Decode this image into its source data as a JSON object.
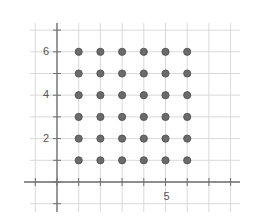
{
  "chart_data": {
    "type": "scatter",
    "title": "",
    "xlabel": "",
    "ylabel": "",
    "xlim": [
      -1,
      8
    ],
    "ylim": [
      -1,
      7
    ],
    "grid": true,
    "x_tick_labels": [
      {
        "value": 5,
        "label": "5"
      }
    ],
    "y_tick_labels": [
      {
        "value": 2,
        "label": "2"
      },
      {
        "value": 4,
        "label": "4"
      },
      {
        "value": 6,
        "label": "6"
      }
    ],
    "points": [
      [
        1,
        1
      ],
      [
        2,
        1
      ],
      [
        3,
        1
      ],
      [
        4,
        1
      ],
      [
        5,
        1
      ],
      [
        6,
        1
      ],
      [
        1,
        2
      ],
      [
        2,
        2
      ],
      [
        3,
        2
      ],
      [
        4,
        2
      ],
      [
        5,
        2
      ],
      [
        6,
        2
      ],
      [
        1,
        3
      ],
      [
        2,
        3
      ],
      [
        3,
        3
      ],
      [
        4,
        3
      ],
      [
        5,
        3
      ],
      [
        6,
        3
      ],
      [
        1,
        4
      ],
      [
        2,
        4
      ],
      [
        3,
        4
      ],
      [
        4,
        4
      ],
      [
        5,
        4
      ],
      [
        6,
        4
      ],
      [
        1,
        5
      ],
      [
        2,
        5
      ],
      [
        3,
        5
      ],
      [
        4,
        5
      ],
      [
        5,
        5
      ],
      [
        6,
        5
      ],
      [
        1,
        6
      ],
      [
        2,
        6
      ],
      [
        3,
        6
      ],
      [
        4,
        6
      ],
      [
        5,
        6
      ],
      [
        6,
        6
      ]
    ],
    "point_color": "#6b6b6b",
    "point_edge_color": "#4a4a4a",
    "grid_color": "#d9d9d9",
    "axis_color": "#6e6e6e"
  }
}
